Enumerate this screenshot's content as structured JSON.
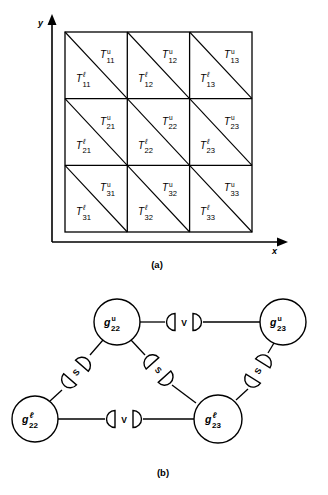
{
  "figure": {
    "panels": [
      {
        "id": "a",
        "caption": "(a)"
      },
      {
        "id": "b",
        "caption": "(b)"
      }
    ]
  },
  "panel_a": {
    "name": "triangular-mesh-grid",
    "axis": {
      "x_label": "x",
      "y_label": "y"
    },
    "grid": {
      "rows": 3,
      "cols": 3,
      "cells": [
        {
          "row": 1,
          "col": 1,
          "upper": {
            "base": "T",
            "sup": "u",
            "sub": "11"
          },
          "lower": {
            "base": "T",
            "sup": "ℓ",
            "sub": "11"
          }
        },
        {
          "row": 1,
          "col": 2,
          "upper": {
            "base": "T",
            "sup": "u",
            "sub": "12"
          },
          "lower": {
            "base": "T",
            "sup": "ℓ",
            "sub": "12"
          }
        },
        {
          "row": 1,
          "col": 3,
          "upper": {
            "base": "T",
            "sup": "u",
            "sub": "13"
          },
          "lower": {
            "base": "T",
            "sup": "ℓ",
            "sub": "13"
          }
        },
        {
          "row": 2,
          "col": 1,
          "upper": {
            "base": "T",
            "sup": "u",
            "sub": "21"
          },
          "lower": {
            "base": "T",
            "sup": "ℓ",
            "sub": "21"
          }
        },
        {
          "row": 2,
          "col": 2,
          "upper": {
            "base": "T",
            "sup": "u",
            "sub": "22"
          },
          "lower": {
            "base": "T",
            "sup": "ℓ",
            "sub": "22"
          }
        },
        {
          "row": 2,
          "col": 3,
          "upper": {
            "base": "T",
            "sup": "u",
            "sub": "23"
          },
          "lower": {
            "base": "T",
            "sup": "ℓ",
            "sub": "23"
          }
        },
        {
          "row": 3,
          "col": 1,
          "upper": {
            "base": "T",
            "sup": "u",
            "sub": "31"
          },
          "lower": {
            "base": "T",
            "sup": "ℓ",
            "sub": "31"
          }
        },
        {
          "row": 3,
          "col": 2,
          "upper": {
            "base": "T",
            "sup": "u",
            "sub": "32"
          },
          "lower": {
            "base": "T",
            "sup": "ℓ",
            "sub": "32"
          }
        },
        {
          "row": 3,
          "col": 3,
          "upper": {
            "base": "T",
            "sup": "u",
            "sub": "33"
          },
          "lower": {
            "base": "T",
            "sup": "ℓ",
            "sub": "33"
          }
        }
      ]
    }
  },
  "panel_b": {
    "name": "adjacency-graph",
    "nodes": [
      {
        "id": "gu22",
        "base": "g",
        "sup": "u",
        "sub": "22"
      },
      {
        "id": "gu23",
        "base": "g",
        "sup": "u",
        "sub": "23"
      },
      {
        "id": "gl22",
        "base": "g",
        "sup": "ℓ",
        "sub": "22"
      },
      {
        "id": "gl23",
        "base": "g",
        "sup": "ℓ",
        "sub": "23"
      }
    ],
    "edges": [
      {
        "from": "gu22",
        "to": "gu23",
        "label": "V"
      },
      {
        "from": "gl22",
        "to": "gl23",
        "label": "V"
      },
      {
        "from": "gu22",
        "to": "gl22",
        "label": "S"
      },
      {
        "from": "gu22",
        "to": "gl23",
        "label": "S"
      },
      {
        "from": "gu23",
        "to": "gl23",
        "label": "S"
      }
    ]
  },
  "colors": {
    "ink": "#000000",
    "paper": "#ffffff"
  }
}
